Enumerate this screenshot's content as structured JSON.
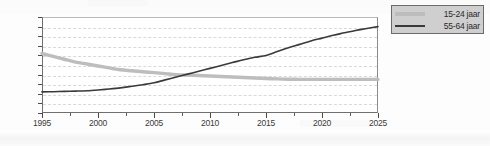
{
  "chart_data": {
    "type": "line",
    "title": "",
    "xlabel": "",
    "ylabel": "",
    "xlim": [
      1995,
      2025
    ],
    "ylim": [
      14,
      24
    ],
    "grid": true,
    "legend_position": "top-right outside",
    "x_ticks": [
      "1995",
      "2000",
      "2005",
      "2010",
      "2015",
      "2020",
      "2025"
    ],
    "y_ticks": [
      "14",
      "15",
      "16",
      "17",
      "18",
      "19",
      "20",
      "21",
      "22",
      "23",
      "24"
    ],
    "x": [
      1995,
      1996,
      1997,
      1998,
      1999,
      2000,
      2001,
      2002,
      2003,
      2004,
      2005,
      2006,
      2007,
      2008,
      2009,
      2010,
      2011,
      2012,
      2013,
      2014,
      2015,
      2016,
      2017,
      2018,
      2019,
      2020,
      2021,
      2022,
      2023,
      2024,
      2025
    ],
    "series": [
      {
        "name": "15-24 jaar",
        "color": "#bdbdbd",
        "width": 3.4,
        "values": [
          20.2,
          19.9,
          19.6,
          19.3,
          19.1,
          18.9,
          18.7,
          18.5,
          18.4,
          18.3,
          18.2,
          18.1,
          18.0,
          17.95,
          17.9,
          17.85,
          17.8,
          17.75,
          17.7,
          17.65,
          17.6,
          17.55,
          17.52,
          17.5,
          17.5,
          17.5,
          17.5,
          17.5,
          17.5,
          17.5,
          17.5
        ]
      },
      {
        "name": "55-64 jaar",
        "color": "#3a3a3a",
        "width": 1.6,
        "values": [
          16.2,
          16.22,
          16.25,
          16.28,
          16.32,
          16.4,
          16.5,
          16.62,
          16.78,
          16.95,
          17.15,
          17.45,
          17.75,
          18.05,
          18.35,
          18.65,
          18.95,
          19.25,
          19.55,
          19.8,
          20.0,
          20.4,
          20.8,
          21.15,
          21.5,
          21.8,
          22.1,
          22.35,
          22.6,
          22.8,
          23.0
        ]
      }
    ]
  },
  "legend": {
    "items": [
      {
        "label": "15-24 jaar",
        "swatch": "thick-gray-line"
      },
      {
        "label": "55-64 jaar",
        "swatch": "thin-dark-line"
      }
    ]
  }
}
